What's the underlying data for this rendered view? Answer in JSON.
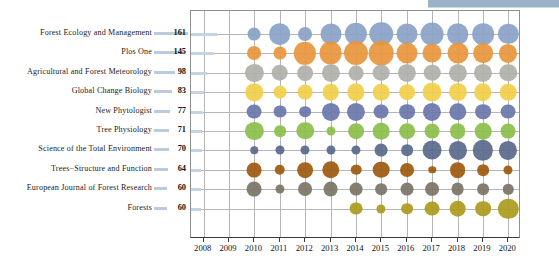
{
  "chart_data": {
    "type": "bubble",
    "title": "",
    "xlabel": "",
    "ylabel": "",
    "x_ticks": [
      2008,
      2009,
      2010,
      2011,
      2012,
      2013,
      2014,
      2015,
      2016,
      2017,
      2018,
      2019,
      2020
    ],
    "xlim": [
      2007.5,
      2020.5
    ],
    "grid": true,
    "legend": "none",
    "categories": [
      "Forest Ecology and Management",
      "Plos One",
      "Agricultural and Forest Meteorology",
      "Global Change Biology",
      "New Phytologist",
      "Tree Physiology",
      "Science of the Total Environment",
      "Trees−Structure and Function",
      "European Journal of Forest Research",
      "Forests"
    ],
    "totals": [
      161,
      145,
      98,
      83,
      77,
      71,
      70,
      64,
      60,
      60
    ],
    "totals_max": 161,
    "series": [
      {
        "name": "Forest Ecology and Management",
        "color": "#8aa2c8",
        "x": [
          2010,
          2011,
          2012,
          2013,
          2014,
          2015,
          2016,
          2017,
          2018,
          2019,
          2020
        ],
        "values": [
          6,
          17,
          7,
          16,
          18,
          20,
          16,
          19,
          17,
          17,
          15
        ]
      },
      {
        "name": "Plos One",
        "color": "#e8963c",
        "x": [
          2010,
          2011,
          2012,
          2013,
          2014,
          2015,
          2016,
          2017,
          2018,
          2019,
          2020
        ],
        "values": [
          7,
          6,
          18,
          19,
          21,
          22,
          16,
          13,
          16,
          14,
          12
        ]
      },
      {
        "name": "Agricultural and Forest Meteorology",
        "color": "#b0b0ab",
        "x": [
          2010,
          2011,
          2012,
          2013,
          2014,
          2015,
          2016,
          2017,
          2018,
          2019,
          2020
        ],
        "values": [
          12,
          10,
          9,
          12,
          8,
          10,
          12,
          10,
          12,
          12,
          11
        ]
      },
      {
        "name": "Global Change Biology",
        "color": "#f2d04a",
        "x": [
          2010,
          2011,
          2012,
          2013,
          2014,
          2015,
          2016,
          2017,
          2018,
          2019,
          2020
        ],
        "values": [
          11,
          6,
          8,
          10,
          11,
          10,
          9,
          13,
          12,
          11,
          10
        ]
      },
      {
        "name": "New Phytologist",
        "color": "#6a77ab",
        "x": [
          2010,
          2011,
          2012,
          2013,
          2014,
          2015,
          2016,
          2017,
          2018,
          2019,
          2020
        ],
        "values": [
          8,
          6,
          5,
          12,
          12,
          8,
          9,
          12,
          11,
          9,
          8
        ]
      },
      {
        "name": "Tree Physiology",
        "color": "#8cbf4a",
        "x": [
          2010,
          2011,
          2012,
          2013,
          2014,
          2015,
          2016,
          2017,
          2018,
          2019,
          2020
        ],
        "values": [
          12,
          5,
          11,
          3,
          9,
          10,
          9,
          8,
          9,
          10,
          8
        ]
      },
      {
        "name": "Science of the Total Environment",
        "color": "#5b6a8c",
        "x": [
          2010,
          2011,
          2012,
          2013,
          2014,
          2015,
          2016,
          2017,
          2018,
          2019,
          2020
        ],
        "values": [
          2,
          3,
          3,
          3,
          3,
          6,
          5,
          13,
          12,
          15,
          12
        ]
      },
      {
        "name": "Trees−Structure and Function",
        "color": "#9d5a10",
        "x": [
          2010,
          2011,
          2012,
          2013,
          2014,
          2015,
          2016,
          2017,
          2018,
          2019,
          2020
        ],
        "values": [
          8,
          4,
          9,
          11,
          4,
          10,
          7,
          2,
          9,
          5,
          3
        ]
      },
      {
        "name": "European Journal of Forest Research",
        "color": "#7b7566",
        "x": [
          2010,
          2011,
          2012,
          2013,
          2014,
          2015,
          2016,
          2017,
          2018,
          2019,
          2020
        ],
        "values": [
          8,
          3,
          7,
          8,
          6,
          5,
          6,
          7,
          6,
          5,
          4
        ]
      },
      {
        "name": "Forests",
        "color": "#ab9c1e",
        "x": [
          2014,
          2015,
          2016,
          2017,
          2018,
          2019,
          2020
        ],
        "values": [
          6,
          3,
          5,
          8,
          10,
          9,
          15
        ]
      }
    ]
  }
}
